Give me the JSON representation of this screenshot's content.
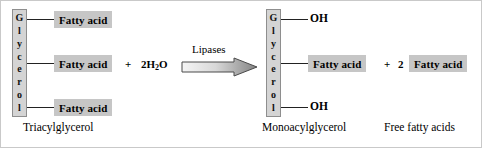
{
  "diagram": {
    "background_color": "#ffffff",
    "box_fill_color": "#c6c6c6",
    "backbone_fill_color": "#d4d4d4",
    "line_color": "#222222"
  },
  "reactant": {
    "backbone_label": "Glycerol",
    "backbone_letters": [
      "G",
      "l",
      "y",
      "c",
      "e",
      "r",
      "o",
      "l"
    ],
    "substituents": [
      {
        "label": "Fatty acid",
        "type": "box"
      },
      {
        "label": "Fatty acid",
        "type": "box"
      },
      {
        "label": "Fatty acid",
        "type": "box"
      }
    ],
    "caption": "Triacylglycerol"
  },
  "coreactant": {
    "plus": "+",
    "formula_prefix": "2H",
    "formula_subscript": "2",
    "formula_suffix": "O",
    "full_text": "2H2O"
  },
  "arrow": {
    "label": "Lipases",
    "direction": "right",
    "gradient_from": "#f2f2f2",
    "gradient_to": "#8c8c8c"
  },
  "product_monoacylglycerol": {
    "backbone_label": "Glycerol",
    "backbone_letters": [
      "G",
      "l",
      "y",
      "c",
      "e",
      "r",
      "o",
      "l"
    ],
    "substituents": [
      {
        "label": "OH",
        "type": "text"
      },
      {
        "label": "Fatty acid",
        "type": "box"
      },
      {
        "label": "OH",
        "type": "text"
      }
    ],
    "caption": "Monoacylglycerol"
  },
  "product_free_fatty_acids": {
    "plus": "+",
    "coefficient": "2",
    "label": "Fatty acid",
    "caption": "Free fatty acids"
  }
}
